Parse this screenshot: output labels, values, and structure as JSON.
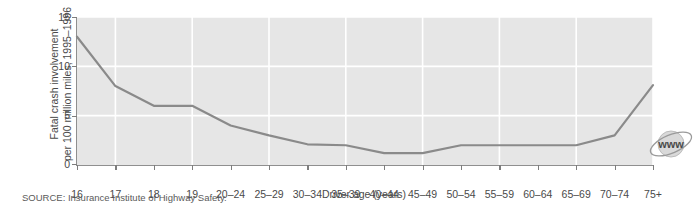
{
  "chart_data": {
    "type": "line",
    "title": "",
    "subtitle": "",
    "xlabel": "Driver age (years)",
    "ylabel_line1": "Fatal crash involvement",
    "ylabel_line2": "per 100 million miles, 1995–1996",
    "categories": [
      "16",
      "17",
      "18",
      "19",
      "20–24",
      "25–29",
      "30–34",
      "35–39",
      "40–44",
      "45–49",
      "50–54",
      "55–59",
      "60–64",
      "65–69",
      "70–74",
      "75+"
    ],
    "values": [
      13.0,
      8.0,
      6.0,
      6.0,
      4.0,
      3.0,
      2.1,
      2.0,
      1.2,
      1.2,
      2.0,
      2.0,
      2.0,
      2.0,
      3.0,
      8.1
    ],
    "ylim": [
      0,
      15
    ],
    "yticks": [
      0,
      5,
      10,
      15
    ],
    "ytick_labels": [
      "0",
      "5",
      "10",
      "15"
    ],
    "grid": true,
    "grid_color": "#ffffff",
    "legend": null,
    "legend_position": "none",
    "line_color": "#8a8a8a",
    "plot_background": "#e6e6e6",
    "axis_color": "#8f8f8f",
    "source_note": "SOURCE: Insurance Institute of Highway Safety.",
    "watermark_text": "www"
  }
}
